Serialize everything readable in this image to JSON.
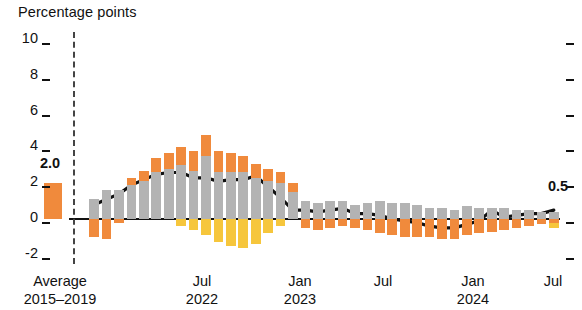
{
  "chart_data": {
    "type": "bar",
    "title": "",
    "ylabel": "Percentage points",
    "xlabel": "",
    "ylim": [
      -2,
      10
    ],
    "yticks": [
      10,
      8,
      6,
      4,
      2,
      0,
      -2
    ],
    "ytick_labels": [
      "10",
      "8",
      "6",
      "4",
      "2",
      "0",
      "-2"
    ],
    "grid": false,
    "legend_position": "none",
    "x_axis_labels": [
      {
        "line1": "Average",
        "line2": "2015–2019"
      },
      {
        "line1": "Jul",
        "line2": "2022"
      },
      {
        "line1": "Jan",
        "line2": "2023"
      },
      {
        "line1": "Jul",
        "line2": ""
      },
      {
        "line1": "Jan",
        "line2": "2024"
      },
      {
        "line1": "Jul",
        "line2": ""
      }
    ],
    "annotations": [
      {
        "text": "2.0",
        "value": 2.0
      },
      {
        "text": "0.5",
        "value": 0.5
      }
    ],
    "series": [
      {
        "name": "Average 2015-2019 stacked contributions",
        "kind": "stacked-bar",
        "bars": [
          {
            "gray": 0.0,
            "orange": 2.0,
            "yellow": 0.0,
            "total": 2.0
          }
        ]
      },
      {
        "name": "Monthly stacked contributions",
        "kind": "stacked-bar",
        "bars": [
          {
            "gray": 1.1,
            "orange": -1.0,
            "yellow": 0.0
          },
          {
            "gray": 1.6,
            "orange": -1.1,
            "yellow": 0.0
          },
          {
            "gray": 1.6,
            "orange": -0.2,
            "yellow": 0.0
          },
          {
            "gray": 1.9,
            "orange": 0.4,
            "yellow": 0.0
          },
          {
            "gray": 2.1,
            "orange": 0.6,
            "yellow": 0.0
          },
          {
            "gray": 2.6,
            "orange": 0.8,
            "yellow": 0.0
          },
          {
            "gray": 2.8,
            "orange": 0.9,
            "yellow": 0.0
          },
          {
            "gray": 3.0,
            "orange": 1.0,
            "yellow": -0.4
          },
          {
            "gray": 2.7,
            "orange": 1.1,
            "yellow": -0.6
          },
          {
            "gray": 3.5,
            "orange": 1.2,
            "yellow": -0.9
          },
          {
            "gray": 2.6,
            "orange": 1.2,
            "yellow": -1.3
          },
          {
            "gray": 2.6,
            "orange": 1.1,
            "yellow": -1.5
          },
          {
            "gray": 2.6,
            "orange": 0.9,
            "yellow": -1.6
          },
          {
            "gray": 2.3,
            "orange": 0.8,
            "yellow": -1.4
          },
          {
            "gray": 2.1,
            "orange": 0.7,
            "yellow": -0.8
          },
          {
            "gray": 2.0,
            "orange": 0.6,
            "yellow": -0.4
          },
          {
            "gray": 1.5,
            "orange": 0.5,
            "yellow": 0.0
          },
          {
            "gray": 1.0,
            "orange": -0.5,
            "yellow": 0.0
          },
          {
            "gray": 0.9,
            "orange": -0.6,
            "yellow": 0.0
          },
          {
            "gray": 1.0,
            "orange": -0.5,
            "yellow": 0.0
          },
          {
            "gray": 1.0,
            "orange": -0.4,
            "yellow": 0.0
          },
          {
            "gray": 0.8,
            "orange": -0.5,
            "yellow": 0.0
          },
          {
            "gray": 0.9,
            "orange": -0.6,
            "yellow": 0.0
          },
          {
            "gray": 1.0,
            "orange": -0.8,
            "yellow": 0.0
          },
          {
            "gray": 0.9,
            "orange": -0.9,
            "yellow": 0.0
          },
          {
            "gray": 0.9,
            "orange": -1.0,
            "yellow": 0.0
          },
          {
            "gray": 0.8,
            "orange": -1.0,
            "yellow": 0.0
          },
          {
            "gray": 0.6,
            "orange": -1.0,
            "yellow": 0.0
          },
          {
            "gray": 0.6,
            "orange": -1.1,
            "yellow": 0.0
          },
          {
            "gray": 0.5,
            "orange": -1.1,
            "yellow": 0.0
          },
          {
            "gray": 0.7,
            "orange": -0.9,
            "yellow": 0.0
          },
          {
            "gray": 0.6,
            "orange": -0.8,
            "yellow": 0.0
          },
          {
            "gray": 0.6,
            "orange": -0.7,
            "yellow": 0.0
          },
          {
            "gray": 0.6,
            "orange": -0.6,
            "yellow": 0.0
          },
          {
            "gray": 0.5,
            "orange": -0.5,
            "yellow": 0.0
          },
          {
            "gray": 0.5,
            "orange": -0.4,
            "yellow": 0.0
          },
          {
            "gray": 0.4,
            "orange": -0.3,
            "yellow": 0.0
          },
          {
            "gray": 0.4,
            "orange": -0.2,
            "yellow": -0.3
          }
        ]
      },
      {
        "name": "Headline line",
        "kind": "line",
        "color": "#111111",
        "values": [
          0.8,
          1.1,
          1.4,
          1.9,
          2.2,
          2.5,
          2.6,
          2.6,
          2.3,
          2.3,
          2.1,
          2.2,
          2.2,
          2.4,
          1.8,
          1.2,
          0.5,
          0.5,
          0.4,
          0.5,
          0.6,
          0.3,
          0.3,
          0.2,
          0.0,
          -0.1,
          -0.2,
          -0.4,
          -0.5,
          -0.5,
          -0.3,
          -0.1,
          0.5,
          0.1,
          0.2,
          0.3,
          0.3,
          0.5
        ]
      }
    ]
  }
}
